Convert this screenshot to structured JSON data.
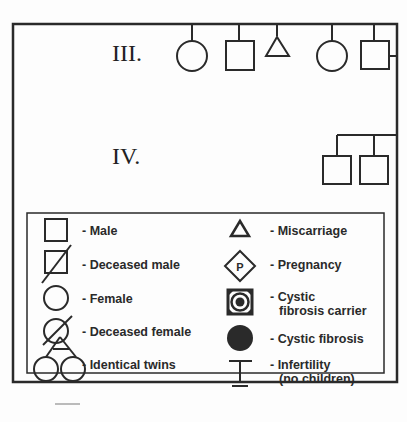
{
  "generations": {
    "III": {
      "label": "III.",
      "individuals": [
        {
          "symbol": "female"
        },
        {
          "symbol": "male"
        },
        {
          "symbol": "miscarriage"
        },
        {
          "symbol": "female"
        },
        {
          "symbol": "male"
        }
      ]
    },
    "IV": {
      "label": "IV.",
      "individuals": [
        {
          "symbol": "male"
        },
        {
          "symbol": "male"
        }
      ]
    }
  },
  "legend": {
    "left": [
      {
        "symbol": "male",
        "label": "- Male"
      },
      {
        "symbol": "deceased-male",
        "label": "- Deceased male"
      },
      {
        "symbol": "female",
        "label": "- Female"
      },
      {
        "symbol": "deceased-female",
        "label": "- Deceased female"
      },
      {
        "symbol": "identical-twins",
        "label": "- Identical twins"
      }
    ],
    "right": [
      {
        "symbol": "miscarriage",
        "label": "- Miscarriage"
      },
      {
        "symbol": "pregnancy",
        "label": "- Pregnancy",
        "glyph": "P"
      },
      {
        "symbol": "cf-carrier",
        "label": "- Cystic",
        "label2": "fibrosis carrier"
      },
      {
        "symbol": "cystic-fibrosis",
        "label": "- Cystic fibrosis"
      },
      {
        "symbol": "infertility",
        "label": "- Infertility",
        "label2": "(no children)"
      }
    ]
  },
  "colors": {
    "line": "#2a2a2a",
    "background": "#fdfdfd"
  }
}
